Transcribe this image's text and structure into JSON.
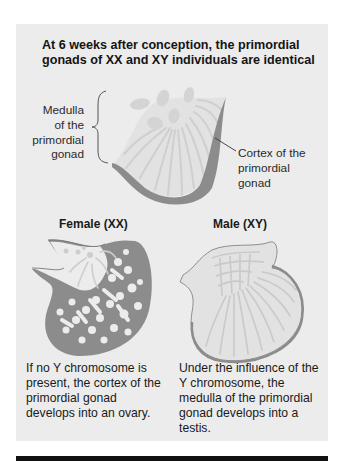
{
  "title": {
    "lines": [
      "At 6 weeks after conception, the primordial",
      "gonads of XX and XY individuals are identical"
    ]
  },
  "labels": {
    "medulla": [
      "Medulla",
      "of the",
      "primordial",
      "gonad"
    ],
    "cortex": [
      "Cortex of the",
      "primordial",
      "gonad"
    ]
  },
  "female": {
    "heading": "Female (XX)",
    "description": [
      "If no Y chromosome is",
      "present, the cortex of the",
      "primordial gonad",
      "develops into an ovary."
    ]
  },
  "male": {
    "heading": "Male (XY)",
    "description": [
      "Under the influence of the",
      "Y chromosome, the",
      "medulla of the primordial",
      "gonad develops into a",
      "testis."
    ]
  },
  "colors": {
    "panel": "#ececec",
    "cortex_dark": "#8c8c8c",
    "medulla_light": "#d3d3d3",
    "outline": "#7a7a7a",
    "bar": "#111111"
  }
}
